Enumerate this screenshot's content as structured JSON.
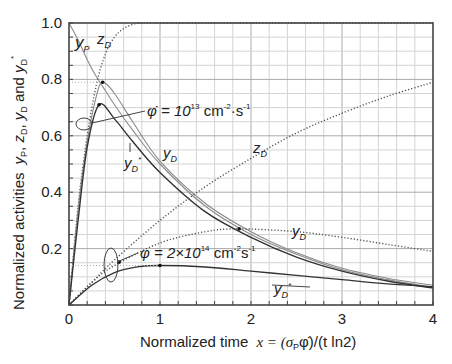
{
  "chart_data": {
    "type": "line",
    "title": "",
    "xlabel": "Normalized time  x = (σPφ̇)/(t ln2)",
    "ylabel": "Normalized activities  yP, zD, yD and yD*",
    "xlim": [
      0,
      4
    ],
    "ylim": [
      0,
      1.0
    ],
    "x_ticks": [
      "0",
      "1",
      "2",
      "3",
      "4"
    ],
    "y_ticks": [
      "0.2",
      "0.4",
      "0.6",
      "0.8",
      "1.0"
    ],
    "grid": true,
    "legend": "inline annotations",
    "annotations": [
      {
        "text": "yP",
        "x": 0.12,
        "y": 0.93
      },
      {
        "text": "zD",
        "x": 0.42,
        "y": 0.93
      },
      {
        "text": "φ̇ = 10^13 cm^-2·s^-1",
        "x": 0.95,
        "y": 0.66
      },
      {
        "text": "yD",
        "x": 1.1,
        "y": 0.55
      },
      {
        "text": "yD*",
        "x": 0.75,
        "y": 0.49
      },
      {
        "text": "zD",
        "x": 1.85,
        "y": 0.37
      },
      {
        "text": "yD",
        "x": 2.7,
        "y": 0.25
      },
      {
        "text": "φ = 2×10^14 cm^-2·s^-1",
        "x": 1.3,
        "y": 0.19
      },
      {
        "text": "yD*",
        "x": 2.55,
        "y": 0.07
      }
    ],
    "series": [
      {
        "name": "yP",
        "style": "solid-light",
        "x": [
          0.0,
          0.1,
          0.2,
          0.3,
          0.4,
          0.5,
          0.7,
          1.0,
          1.5,
          2.0,
          2.5,
          3.0,
          3.5,
          4.0
        ],
        "y": [
          1.0,
          0.94,
          0.87,
          0.81,
          0.76,
          0.71,
          0.62,
          0.5,
          0.35,
          0.25,
          0.18,
          0.125,
          0.09,
          0.0625
        ]
      },
      {
        "name": "zD (φ̇=1e13)",
        "style": "dotted",
        "x": [
          0.0,
          0.1,
          0.2,
          0.3,
          0.4,
          0.5,
          0.6,
          0.7,
          0.8,
          1.0,
          1.5,
          4.0
        ],
        "y": [
          0.0,
          0.35,
          0.6,
          0.78,
          0.89,
          0.95,
          0.98,
          0.995,
          1.0,
          1.0,
          1.0,
          1.0
        ]
      },
      {
        "name": "yD (φ̇=1e13)",
        "style": "solid-light",
        "x": [
          0.0,
          0.1,
          0.2,
          0.3,
          0.37,
          0.5,
          0.7,
          1.0,
          1.5,
          2.0,
          2.5,
          3.0,
          3.5,
          4.0
        ],
        "y": [
          0.0,
          0.34,
          0.58,
          0.74,
          0.79,
          0.75,
          0.65,
          0.51,
          0.36,
          0.26,
          0.185,
          0.13,
          0.095,
          0.07
        ]
      },
      {
        "name": "yD* (φ̇=1e13)",
        "style": "solid-dark",
        "x": [
          0.0,
          0.1,
          0.2,
          0.33,
          0.5,
          0.7,
          1.0,
          1.5,
          2.0,
          2.5,
          3.0,
          3.5,
          4.0
        ],
        "y": [
          0.0,
          0.3,
          0.56,
          0.71,
          0.66,
          0.58,
          0.47,
          0.33,
          0.24,
          0.17,
          0.12,
          0.085,
          0.06
        ]
      },
      {
        "name": "zD (φ=2e14)",
        "style": "dotted",
        "x": [
          0.0,
          0.25,
          0.5,
          1.0,
          1.5,
          2.0,
          2.5,
          3.0,
          3.5,
          4.0
        ],
        "y": [
          0.0,
          0.08,
          0.16,
          0.3,
          0.42,
          0.52,
          0.61,
          0.68,
          0.74,
          0.79
        ]
      },
      {
        "name": "yD (φ=2e14)",
        "style": "dotted",
        "x": [
          0.0,
          0.25,
          0.5,
          1.0,
          1.5,
          1.87,
          2.5,
          3.0,
          3.5,
          4.0
        ],
        "y": [
          0.0,
          0.08,
          0.14,
          0.22,
          0.26,
          0.27,
          0.26,
          0.24,
          0.215,
          0.19
        ]
      },
      {
        "name": "yD* (φ=2e14)",
        "style": "solid-dark",
        "x": [
          0.0,
          0.25,
          0.5,
          0.75,
          1.0,
          1.5,
          2.0,
          2.5,
          3.0,
          3.5,
          4.0
        ],
        "y": [
          0.0,
          0.07,
          0.115,
          0.135,
          0.14,
          0.135,
          0.12,
          0.105,
          0.09,
          0.075,
          0.065
        ]
      }
    ],
    "markers": [
      {
        "x": 0.37,
        "y": 0.79
      },
      {
        "x": 0.33,
        "y": 0.71
      },
      {
        "x": 1.87,
        "y": 0.27
      },
      {
        "x": 1.0,
        "y": 0.14
      },
      {
        "x": 0.55,
        "y": 0.152
      }
    ]
  },
  "labels": {
    "x_axis": "Normalized time",
    "x_formula": "x = (σ",
    "x_formula_sub": "P",
    "x_formula_rest": "φ̇)/(t ln2)",
    "y_axis_prefix": "Normalized activities",
    "tick_x": [
      "0",
      "1",
      "2",
      "3",
      "4"
    ],
    "tick_y": [
      "0.2",
      "0.4",
      "0.6",
      "0.8",
      "1.0"
    ],
    "yP": "y",
    "yP_sub": "P",
    "zD": "z",
    "zD_sub": "D",
    "yD": "y",
    "yD_sub": "D",
    "star": "*",
    "flux1_main": "φ̇ = 10",
    "flux1_exp": "13",
    "flux1_unit": " cm",
    "flux1_unit_exp": "-2",
    "flux1_unit_rest": "·s",
    "flux1_unit_exp2": "-1",
    "flux2_main": "φ = 2×10",
    "flux2_exp": "14",
    "flux2_unit": " cm",
    "flux2_unit_exp": "-2",
    "flux2_unit_rest": "s",
    "flux2_unit_exp2": "-1",
    "y_axis_vars": "y",
    "y_axis_and": " and "
  }
}
